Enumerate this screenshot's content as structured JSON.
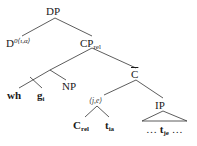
{
  "diagram": {
    "type": "syntax-tree",
    "nodes": {
      "root": {
        "label": "DP"
      },
      "determiner": {
        "label": "D",
        "sup": "0",
        "type_sup": "⟨ι,α⟩"
      },
      "cp_rel": {
        "label": "CP",
        "sub": "rel"
      },
      "wh_phrase": {
        "label": ""
      },
      "wh": {
        "label": "wh"
      },
      "g": {
        "label": "g",
        "sub": "i"
      },
      "np": {
        "label": "NP"
      },
      "c_bar": {
        "label": "C"
      },
      "lambda_type": {
        "label": "⟨j,e⟩"
      },
      "ip": {
        "label": "IP"
      },
      "c_rel": {
        "label": "C",
        "sub": "rel"
      },
      "t_ia": {
        "label": "t",
        "sub": "ia"
      },
      "ip_content": {
        "pre": "… ",
        "label": "t",
        "sub": "je",
        "post": " …"
      }
    },
    "edges": [
      [
        "root",
        "determiner"
      ],
      [
        "root",
        "cp_rel"
      ],
      [
        "cp_rel",
        "wh_phrase"
      ],
      [
        "cp_rel",
        "c_bar"
      ],
      [
        "wh_phrase",
        "wh"
      ],
      [
        "wh_phrase",
        "g"
      ],
      [
        "wh_phrase",
        "np"
      ],
      [
        "c_bar",
        "lambda_type"
      ],
      [
        "c_bar",
        "ip"
      ],
      [
        "lambda_type",
        "c_rel"
      ],
      [
        "lambda_type",
        "t_ia"
      ],
      [
        "ip",
        "ip_content"
      ]
    ]
  }
}
